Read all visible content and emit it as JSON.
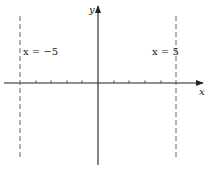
{
  "diagram": {
    "type": "coordinate-axes-with-vertical-asymptotes",
    "axes": {
      "x_label": "x",
      "y_label": "y",
      "tick_count_each_side": 4
    },
    "vertical_lines": [
      {
        "label": "x = −5",
        "x_value": -5,
        "style": "dashed"
      },
      {
        "label": "x = 5",
        "x_value": 5,
        "style": "dashed"
      }
    ],
    "colors": {
      "axis": "#222222",
      "dashed": "#555555",
      "background": "#ffffff"
    }
  }
}
